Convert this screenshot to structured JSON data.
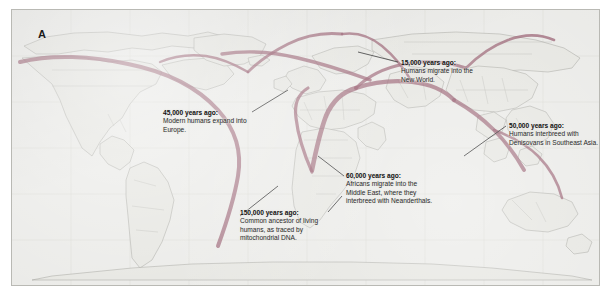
{
  "figure": {
    "panel_letter": "A",
    "type": "world-migration-map",
    "background_color": "#e9e9e6",
    "route_color": "#8a4a5e",
    "leader_color": "#1d1d1d"
  },
  "callouts": [
    {
      "id": "c15",
      "heading": "15,000 years ago:",
      "body": "Humans migrate into the New World.",
      "anchor": "north-america-northwest"
    },
    {
      "id": "c45",
      "heading": "45,000 years ago:",
      "body": "Modern humans expand into Europe.",
      "anchor": "europe"
    },
    {
      "id": "c50",
      "heading": "50,000 years ago:",
      "body": "Humans interbreed with Denisovans in Southeast Asia.",
      "anchor": "southeast-asia"
    },
    {
      "id": "c60",
      "heading": "60,000 years ago:",
      "body": "Africans migrate into the Middle East, where they interbreed with Neanderthals.",
      "anchor": "middle-east"
    },
    {
      "id": "c150",
      "heading": "150,000 years ago:",
      "body": "Common ancestor of living humans, as traced by mitochondrial DNA.",
      "anchor": "east-africa"
    }
  ]
}
